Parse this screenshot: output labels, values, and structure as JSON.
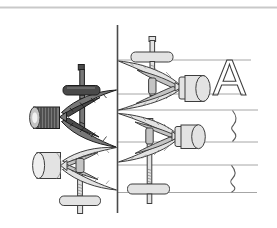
{
  "figure": {
    "label": "A",
    "parts": {
      "top_border": "border-line",
      "divider": "vertical-divider-line",
      "left_column": [
        "dark-clamp-with-knurled-knob",
        "light-clamp-with-cylinder-knob"
      ],
      "right_column": [
        "clamp-gripping-rod-screw-up",
        "clamp-gripping-rod-screw-down"
      ],
      "rods": [
        "lettered-rod",
        "broken-rod-middle",
        "broken-rod-bottom"
      ],
      "annotations": [
        "letter-label",
        "break-marks",
        "guide-lines"
      ]
    }
  },
  "colors": {
    "paper": "#ffffff",
    "ink": "#3d3d3d",
    "line-light": "#a6a6a6",
    "border-gray": "#c9c9c9",
    "fill-light": "#e3e3e3",
    "fill-mid": "#c4c4c4",
    "fill-dark": "#787878",
    "ink-dark": "#1c1c1c"
  }
}
